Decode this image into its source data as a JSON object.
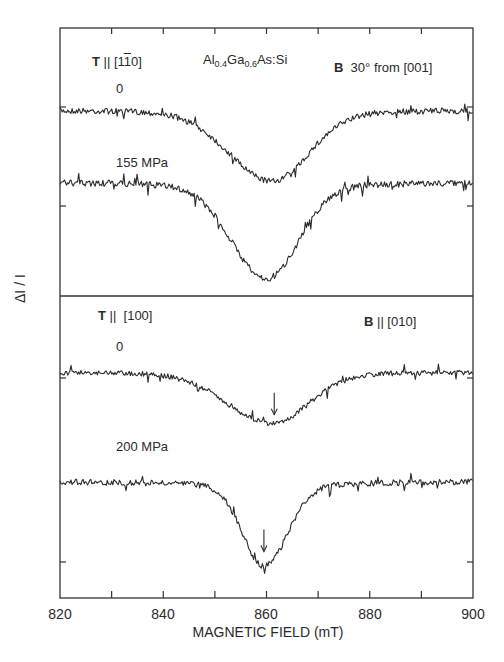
{
  "chart_data": [
    {
      "type": "line",
      "panel": "upper",
      "title": "Al0.4Ga0.6As:Si",
      "stress_direction": "T || [1-10]",
      "field_direction": "B 30° from [001]",
      "xlabel": "MAGNETIC FIELD (mT)",
      "ylabel": "ΔI / I",
      "xlim": [
        820,
        900
      ],
      "series": [
        {
          "name": "0",
          "baseline": 0,
          "dip_center_mT": 861,
          "dip_depth_rel": 0.7,
          "dip_fwhm_mT": 14
        },
        {
          "name": "155 MPa",
          "baseline": 0,
          "dip_center_mT": 860,
          "dip_depth_rel": 1.0,
          "dip_fwhm_mT": 12
        }
      ]
    },
    {
      "type": "line",
      "panel": "lower",
      "stress_direction": "T || [100]",
      "field_direction": "B || [010]",
      "xlabel": "MAGNETIC FIELD (mT)",
      "ylabel": "ΔI / I",
      "xlim": [
        820,
        900
      ],
      "series": [
        {
          "name": "0",
          "baseline": 0,
          "dip_center_mT": 861,
          "dip_depth_rel": 0.5,
          "dip_fwhm_mT": 14,
          "arrow_mT": 861.5
        },
        {
          "name": "200 MPa",
          "baseline": 0,
          "dip_center_mT": 859.5,
          "dip_depth_rel": 0.86,
          "dip_fwhm_mT": 9,
          "arrow_mT": 859.5
        }
      ]
    }
  ],
  "axis": {
    "x_ticks": [
      "820",
      "840",
      "860",
      "880",
      "900"
    ],
    "x_tick_values": [
      820,
      840,
      860,
      880,
      900
    ],
    "x_minor_step": 10,
    "xlabel": "MAGNETIC FIELD (mT)",
    "ylabel": "ΔI / I"
  },
  "upper": {
    "stress_T": "T",
    "stress_rest": " || [1",
    "stress_bar": "1",
    "stress_end": "0]",
    "sample_main": "Al",
    "sample_sub1": "0.4",
    "sample_mid": "Ga",
    "sample_sub2": "0.6",
    "sample_end": "As:Si",
    "field_B": "B",
    "field_rest": "  30° from [001]",
    "curve1_label": "0",
    "curve2_label": "155 MPa"
  },
  "lower": {
    "stress_T": "T",
    "stress_rest": " ||  [100]",
    "field_B": "B",
    "field_rest": " || [010]",
    "curve1_label": "0",
    "curve2_label": "200 MPa"
  },
  "style": {
    "line_color": "#2b2b2b",
    "frame_color": "#333333"
  }
}
